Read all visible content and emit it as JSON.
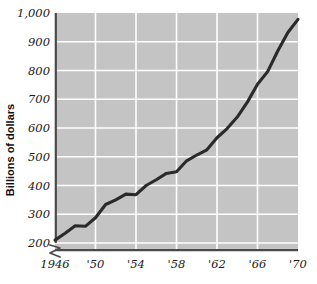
{
  "chart_data": {
    "type": "line",
    "title": "",
    "xlabel": "",
    "ylabel": "Billions of dollars",
    "xlim": [
      1946,
      1970
    ],
    "ylim": [
      200,
      1000
    ],
    "grid": true,
    "legend": false,
    "axis_break_y": true,
    "x_tick_labels": [
      "1946",
      "'50",
      "'54",
      "'58",
      "'62",
      "'66",
      "'70"
    ],
    "x_tick_values": [
      1946,
      1950,
      1954,
      1958,
      1962,
      1966,
      1970
    ],
    "y_tick_labels": [
      "200",
      "300",
      "400",
      "500",
      "600",
      "700",
      "800",
      "900",
      "1,000"
    ],
    "y_tick_values": [
      200,
      300,
      400,
      500,
      600,
      700,
      800,
      900,
      1000
    ],
    "series": [
      {
        "name": "Gross national product",
        "x": [
          1946,
          1947,
          1948,
          1949,
          1950,
          1951,
          1952,
          1953,
          1954,
          1955,
          1956,
          1957,
          1958,
          1959,
          1960,
          1961,
          1962,
          1963,
          1964,
          1965,
          1966,
          1967,
          1968,
          1969,
          1970
        ],
        "values": [
          210,
          234,
          260,
          258,
          288,
          334,
          350,
          370,
          368,
          400,
          420,
          442,
          448,
          486,
          506,
          524,
          566,
          598,
          638,
          690,
          752,
          796,
          868,
          932,
          978
        ]
      }
    ]
  },
  "colors": {
    "plot_background": "#c4c4c4",
    "gridline": "#ffffff",
    "line": "#2a2a2a",
    "axis": "#4a4a4a",
    "text": "#1b1b1b",
    "page_background": "#ffffff"
  }
}
